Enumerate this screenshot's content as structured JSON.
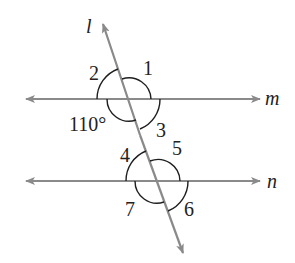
{
  "diagram": {
    "type": "parallel-lines-transversal",
    "colors": {
      "line": "#8a8a8a",
      "arc": "#1e1e1e",
      "text": "#222222",
      "background": "#ffffff"
    },
    "lines": {
      "transversal": {
        "label": "l"
      },
      "top_parallel": {
        "label": "m"
      },
      "bottom_parallel": {
        "label": "n"
      }
    },
    "angles": {
      "angle_1": "1",
      "angle_2": "2",
      "angle_3": "3",
      "angle_4": "4",
      "angle_5": "5",
      "angle_6": "6",
      "angle_7": "7",
      "given_angle": "110°"
    }
  }
}
